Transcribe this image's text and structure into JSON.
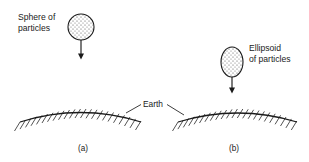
{
  "figure": {
    "background_color": "#ffffff",
    "ink_color": "#1a1a1a",
    "width": 309,
    "height": 162
  },
  "labels": {
    "sphere_line1": "Sphere of",
    "sphere_line2": "particles",
    "ellipsoid_line1": "Ellipsoid",
    "ellipsoid_line2": "of particles",
    "earth": "Earth",
    "caption_a": "(a)",
    "caption_b": "(b)"
  },
  "panel_a": {
    "body_shape": "circle",
    "body_center_x": 81,
    "body_center_y": 27,
    "body_radius": 13,
    "arrow_from_y": 40,
    "arrow_to_y": 59,
    "arrow_x": 81,
    "surface_start_x": 20,
    "surface_end_x": 141,
    "surface_peak_y": 110,
    "surface_edge_y": 122,
    "hatch_count": 22
  },
  "panel_b": {
    "body_shape": "ellipse",
    "body_center_x": 232,
    "body_center_y": 62,
    "body_radius_x": 11,
    "body_radius_y": 15,
    "arrow_from_y": 77,
    "arrow_to_y": 93,
    "arrow_x": 232,
    "surface_start_x": 178,
    "surface_end_x": 297,
    "surface_peak_y": 111,
    "surface_edge_y": 122,
    "hatch_count": 22
  },
  "earth_leader": {
    "text_x": 145,
    "text_y": 107,
    "left_line": "from label down-left to panel a surface",
    "right_line": "from label down-right to panel b surface"
  }
}
